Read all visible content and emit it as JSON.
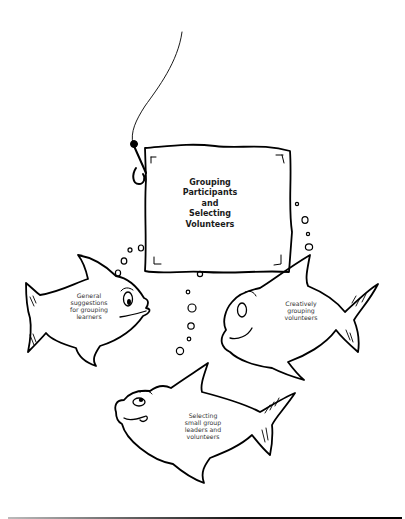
{
  "illustration": {
    "sign": {
      "title": "Grouping\nParticipants\nand\nSelecting\nVolunteers"
    },
    "fish": [
      {
        "label": "General\nsuggestions\nfor grouping\nlearners"
      },
      {
        "label": "Creatively\ngrouping\nvolunteers"
      },
      {
        "label": "Selecting\nsmall group\nleaders and\nvolunteers"
      }
    ]
  },
  "colors": {
    "stroke": "#000000",
    "background": "#ffffff"
  }
}
